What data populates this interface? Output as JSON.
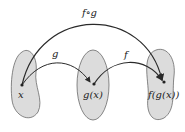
{
  "diagram": {
    "colors": {
      "set_fill": "#dcdcdc",
      "set_stroke": "#6a6a6a",
      "arrow": "#2a2a2a",
      "text": "#222222"
    },
    "sets": [
      {
        "id": "domain",
        "point_label": "x"
      },
      {
        "id": "middle",
        "point_label": "g(x)"
      },
      {
        "id": "codomain",
        "point_label": "f(g(x))"
      }
    ],
    "arrows": [
      {
        "id": "g",
        "label": "g",
        "from": "x",
        "to": "g(x)"
      },
      {
        "id": "f",
        "label": "f",
        "from": "g(x)",
        "to": "f(g(x))"
      },
      {
        "id": "fog",
        "label": "f∘g",
        "from": "x",
        "to": "f(g(x))"
      }
    ]
  }
}
